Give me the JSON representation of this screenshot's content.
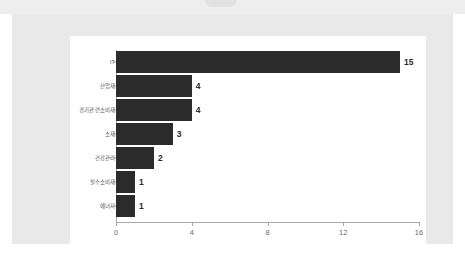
{
  "chart_data": {
    "type": "bar",
    "orientation": "horizontal",
    "title": "",
    "subtitle": "",
    "xlabel": "",
    "ylabel": "",
    "xlim": [
      0,
      16
    ],
    "xticks": [
      0,
      4,
      8,
      12,
      16
    ],
    "xtick_labels": [
      "0",
      "4",
      "8",
      "12",
      "16"
    ],
    "grid": false,
    "legend": null,
    "bar_color": "#2b2b2b",
    "axis_color": "#a8a8a8",
    "label_color": "#555555",
    "tick_label_color": "#6b6b6b",
    "panel_background": "#ffffff",
    "frame_background": "#e9e9e9",
    "categories": [
      "IT",
      "산업재",
      "경기관련소비재",
      "소재",
      "건강관리",
      "필수소비재",
      "에너지"
    ],
    "values": [
      15,
      4,
      4,
      3,
      2,
      1,
      1
    ],
    "data_labels": [
      "15",
      "4",
      "4",
      "3",
      "2",
      "1",
      "1"
    ],
    "series": [
      {
        "name": "",
        "values": [
          15,
          4,
          4,
          3,
          2,
          1,
          1
        ]
      }
    ]
  }
}
